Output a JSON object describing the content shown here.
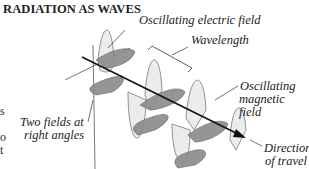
{
  "title": "RADIATION AS WAVES",
  "labels": {
    "electric": "Oscillating electric field",
    "wavelength": "Wavelength",
    "magnetic_1": "Oscillating",
    "magnetic_2": "magnetic field",
    "right_angles_1": "Two fields at",
    "right_angles_2": "right angles",
    "direction_1": "Direction",
    "direction_2": "of travel"
  },
  "edge_fragments": [
    "s",
    "o",
    "t"
  ],
  "colors": {
    "electric_fill": "#e8e8e8",
    "magnetic_fill": "#8a8a8a",
    "line": "#222222"
  }
}
